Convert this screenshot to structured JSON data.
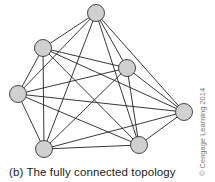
{
  "diagram": {
    "caption": "(b) The fully connected topology",
    "copyright": "© Cengage Learning 2014",
    "node_fill": "#d0d0d0",
    "node_stroke": "#333333",
    "edge_color": "#222222",
    "nodes": [
      {
        "id": "top",
        "x": 96,
        "y": 13
      },
      {
        "id": "upper-left",
        "x": 43,
        "y": 48
      },
      {
        "id": "inner-right",
        "x": 127,
        "y": 68
      },
      {
        "id": "left",
        "x": 18,
        "y": 94
      },
      {
        "id": "far-right",
        "x": 184,
        "y": 112
      },
      {
        "id": "bottom-left",
        "x": 44,
        "y": 149
      },
      {
        "id": "bottom-right",
        "x": 139,
        "y": 145
      }
    ],
    "edges": "all-pairs"
  }
}
